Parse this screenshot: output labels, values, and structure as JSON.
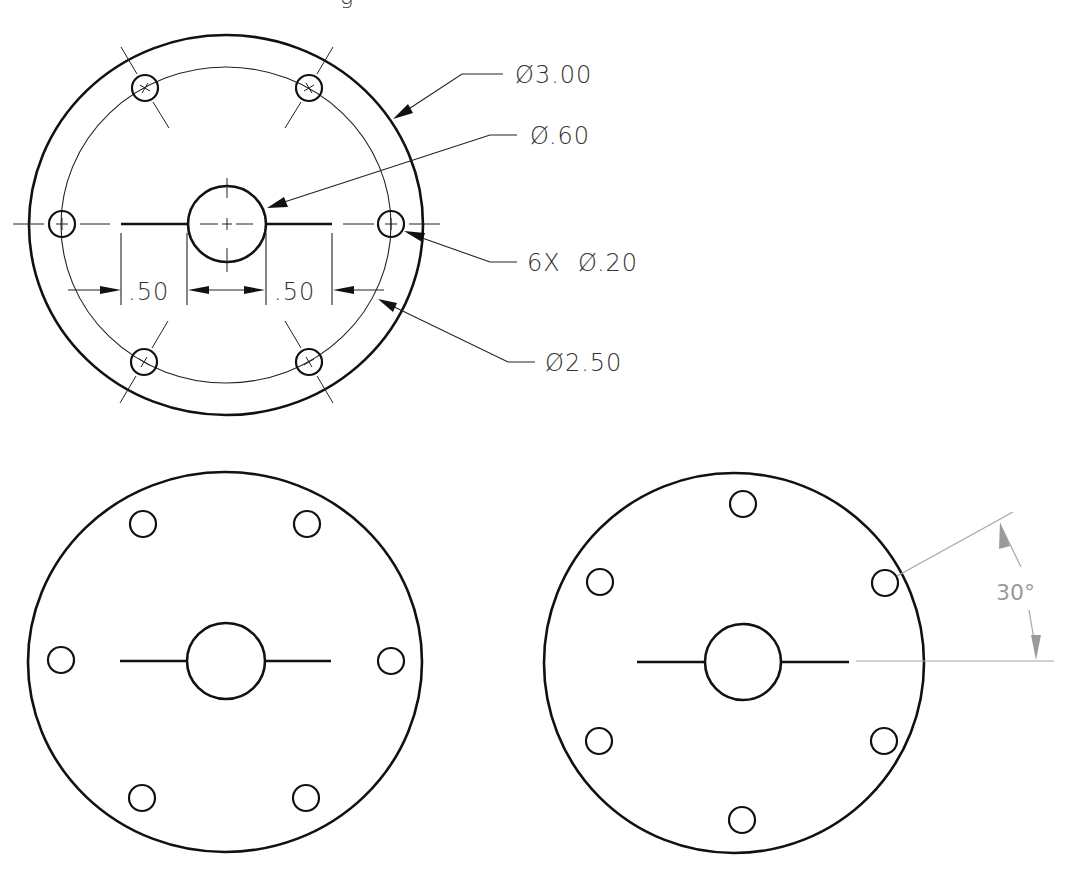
{
  "title_fragment": "g",
  "top_view": {
    "labels": {
      "outer_diameter": "Ø3.00",
      "center_hole_diameter": "Ø.60",
      "bolt_holes": "6X  Ø.20",
      "bolt_circle_diameter": "Ø2.50",
      "slot_left_length": ".50",
      "slot_right_length": ".50"
    },
    "hole_count": 6
  },
  "bottom_left_view": {
    "hole_count": 6,
    "orientation": "holes at 0°, 60°, 120°, 180°, 240°, 300°"
  },
  "bottom_right_view": {
    "hole_count": 6,
    "orientation": "holes rotated 30°",
    "angle_label": "30°"
  },
  "colors": {
    "line": "#111111",
    "dimension_gray": "#9a9a9a",
    "text": "#333333"
  }
}
